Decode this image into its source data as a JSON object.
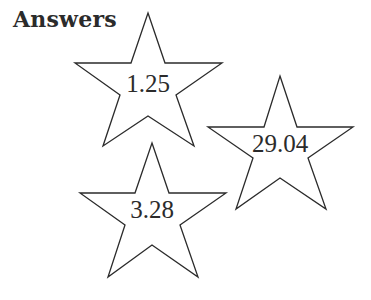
{
  "heading": "Answers",
  "stars": [
    {
      "value": "1.25"
    },
    {
      "value": "29.04"
    },
    {
      "value": "3.28"
    }
  ],
  "colors": {
    "stroke": "#2b2b2b",
    "text": "#2b2b2b",
    "background": "#ffffff"
  }
}
